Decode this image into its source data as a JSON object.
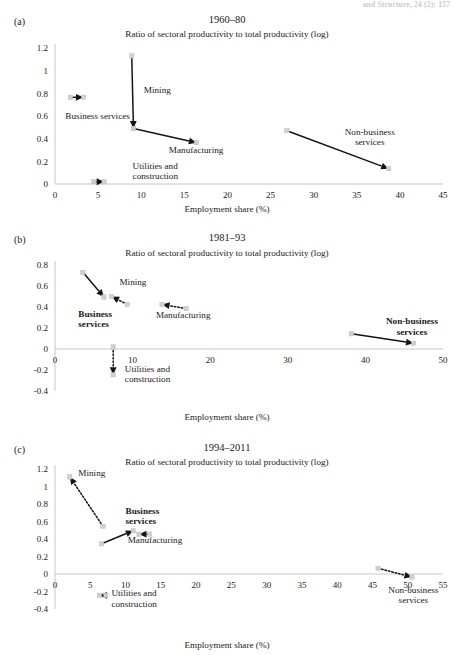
{
  "running_head": "and Structure, 24 (2): 157",
  "common": {
    "subtitle": "Ratio of sectoral productivity to total productivity (log)",
    "xlabel": "Employment share (%)",
    "sector_names": {
      "mining": "Mining",
      "business_services": "Business services",
      "business_services_l1": "Business",
      "business_services_l2": "services",
      "manufacturing": "Manufacturing",
      "utilities_l1": "Utilities and",
      "utilities_l2": "construction",
      "nonbusiness_l1": "Non-business",
      "nonbusiness_l2": "services"
    },
    "colors": {
      "marker": "#cfcfd4",
      "arrow": "#141414",
      "axis": "#b9b9bf",
      "text": "#1a1a1a"
    }
  },
  "panels": [
    {
      "id": "a",
      "letter": "(a)",
      "title": "1960–80",
      "subtitle": "Ratio of sectoral productivity to total productivity (log)",
      "xlabel": "Employment share (%)",
      "chart_data": {
        "type": "scatter",
        "title": "1960–80",
        "xlabel": "Employment share (%)",
        "ylabel": "Ratio of sectoral productivity to total productivity (log)",
        "xlim": [
          0,
          45
        ],
        "ylim": [
          0,
          1.2
        ],
        "xticks": [
          0,
          5,
          10,
          15,
          20,
          25,
          30,
          35,
          40,
          45
        ],
        "xtick_labels": [
          "0",
          "5",
          "10",
          "15",
          "20",
          "25",
          "30",
          "35",
          "40",
          "45"
        ],
        "yticks": [
          0,
          0.2,
          0.4,
          0.6,
          0.8,
          1,
          1.2
        ],
        "ytick_labels": [
          "0",
          "0.2",
          "0.4",
          "0.6",
          "0.8",
          "1",
          "1.2"
        ],
        "grid": false,
        "legend": "none",
        "series": [
          {
            "name": "Mining",
            "style": "solid",
            "start": [
              8.9,
              1.13
            ],
            "end": [
              9.1,
              0.49
            ],
            "label_bold": false
          },
          {
            "name": "Business services",
            "style": "solid",
            "start": [
              1.8,
              0.765
            ],
            "end": [
              3.3,
              0.765
            ],
            "label_bold": false
          },
          {
            "name": "Manufacturing",
            "style": "solid",
            "start": [
              9.1,
              0.49
            ],
            "end": [
              16.4,
              0.365
            ],
            "label_bold": false
          },
          {
            "name": "Utilities and construction",
            "style": "solid",
            "start": [
              4.5,
              0.02
            ],
            "end": [
              5.7,
              0.02
            ],
            "label_bold": false
          },
          {
            "name": "Non-business services",
            "style": "solid",
            "start": [
              26.9,
              0.47
            ],
            "end": [
              38.7,
              0.135
            ],
            "label_bold": false
          }
        ]
      }
    },
    {
      "id": "b",
      "letter": "(b)",
      "title": "1981–93",
      "subtitle": "Ratio of sectoral productivity to total productivity (log)",
      "xlabel": "Employment share (%)",
      "chart_data": {
        "type": "scatter",
        "title": "1981–93",
        "xlabel": "Employment share (%)",
        "ylabel": "Ratio of sectoral productivity to total productivity (log)",
        "xlim": [
          0,
          50
        ],
        "ylim": [
          -0.4,
          0.8
        ],
        "xticks": [
          0,
          10,
          20,
          30,
          40,
          50
        ],
        "xtick_labels": [
          "0",
          "10",
          "20",
          "30",
          "40",
          "50"
        ],
        "yticks": [
          -0.4,
          -0.2,
          0,
          0.2,
          0.4,
          0.6,
          0.8
        ],
        "ytick_labels": [
          "-0.4",
          "-0.2",
          "0",
          "0.2",
          "0.4",
          "0.6",
          "0.8"
        ],
        "grid": false,
        "legend": "none",
        "series": [
          {
            "name": "Business services",
            "style": "solid",
            "start": [
              3.6,
              0.73
            ],
            "end": [
              6.3,
              0.495
            ],
            "label_bold": true
          },
          {
            "name": "Mining",
            "style": "dotted",
            "start": [
              9.3,
              0.425
            ],
            "end": [
              7.3,
              0.5
            ],
            "label_bold": false
          },
          {
            "name": "Manufacturing",
            "style": "dotted",
            "start": [
              16.9,
              0.385
            ],
            "end": [
              13.8,
              0.425
            ],
            "label_bold": false
          },
          {
            "name": "Utilities and construction",
            "style": "dotted",
            "start": [
              7.5,
              0.02
            ],
            "end": [
              7.5,
              -0.245
            ],
            "label_bold": false
          },
          {
            "name": "Non-business services",
            "style": "solid",
            "start": [
              38.2,
              0.145
            ],
            "end": [
              46.2,
              0.055
            ],
            "label_bold": true
          }
        ]
      }
    },
    {
      "id": "c",
      "letter": "(c)",
      "title": "1994–2011",
      "subtitle": "Ratio of sectoral productivity to total productivity (log)",
      "xlabel": "Employment share (%)",
      "chart_data": {
        "type": "scatter",
        "title": "1994–2011",
        "xlabel": "Employment share (%)",
        "ylabel": "Ratio of sectoral productivity to total productivity (log)",
        "xlim": [
          0,
          55
        ],
        "ylim": [
          -0.4,
          1.2
        ],
        "xticks": [
          0,
          5,
          10,
          15,
          20,
          25,
          30,
          35,
          40,
          45,
          50,
          55
        ],
        "xtick_labels": [
          "0",
          "5",
          "10",
          "15",
          "20",
          "25",
          "30",
          "35",
          "40",
          "45",
          "50",
          "55"
        ],
        "yticks": [
          -0.4,
          -0.2,
          0,
          0.2,
          0.4,
          0.6,
          0.8,
          1,
          1.2
        ],
        "ytick_labels": [
          "-0.4",
          "-0.2",
          "0",
          "0.2",
          "0.4",
          "0.6",
          "0.8",
          "1",
          "1.2"
        ],
        "grid": false,
        "legend": "none",
        "series": [
          {
            "name": "Mining",
            "style": "dotted",
            "start": [
              6.8,
              0.545
            ],
            "end": [
              2.1,
              1.11
            ],
            "label_bold": false
          },
          {
            "name": "Business services",
            "style": "solid",
            "start": [
              6.6,
              0.345
            ],
            "end": [
              11.1,
              0.495
            ],
            "label_bold": true
          },
          {
            "name": "Manufacturing",
            "style": "solid",
            "start": [
              13.4,
              0.455
            ],
            "end": [
              11.9,
              0.455
            ],
            "label_bold": false
          },
          {
            "name": "Utilities and construction",
            "style": "solid",
            "start": [
              7.2,
              -0.245
            ],
            "end": [
              6.3,
              -0.245
            ],
            "label_bold": false
          },
          {
            "name": "Non-business services",
            "style": "dotted",
            "start": [
              45.8,
              0.065
            ],
            "end": [
              50.6,
              -0.035
            ],
            "label_bold": false
          }
        ]
      }
    }
  ]
}
